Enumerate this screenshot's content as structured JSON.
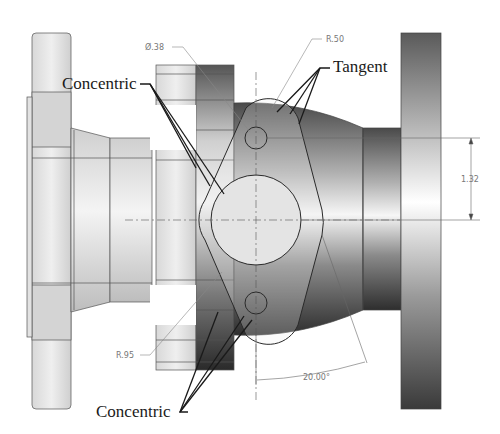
{
  "drawing": {
    "type": "CAD mechanical drawing - flange mate constraints",
    "annotations": {
      "concentric_top": "Concentric",
      "concentric_bottom": "Concentric",
      "tangent": "Tangent"
    },
    "dimensions": {
      "hole_diameter": "Ø.38",
      "flange_radius_top": "R.50",
      "flange_radius_bottom": "R.95",
      "hole_spacing": "1.32",
      "angle": "20.00°"
    },
    "colors": {
      "line": "#333333",
      "dim_line": "#888888",
      "part_light": "#e6e6e6",
      "part_dark": "#3a3a3a",
      "leader": "#1a1a1a"
    }
  }
}
